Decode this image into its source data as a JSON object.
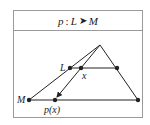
{
  "header": {
    "map_name": "p",
    "colon": ":",
    "domain": "L",
    "arrow": "➤",
    "codomain": "M"
  },
  "labels": {
    "line_L": "L",
    "line_M": "M",
    "point_x": "x",
    "point_px": "p(x)"
  },
  "colors": {
    "border": "#9a9a9a",
    "stroke": "#222222"
  }
}
